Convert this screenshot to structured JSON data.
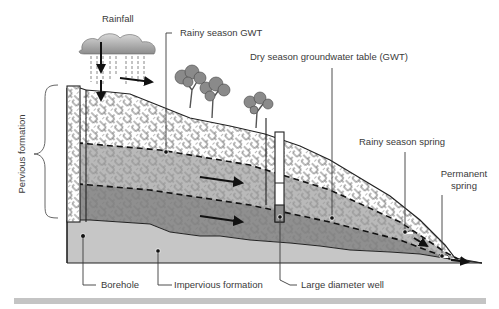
{
  "labels": {
    "rainfall": "Rainfall",
    "rainy_gwt": "Rainy season GWT",
    "dry_gwt": "Dry season groundwater table (GWT)",
    "rainy_spring": "Rainy season spring",
    "permanent_spring_line1": "Permanent",
    "permanent_spring_line2": "spring",
    "pervious_formation": "Pervious formation",
    "borehole": "Borehole",
    "impervious_formation": "Impervious formation",
    "large_diameter_well": "Large diameter well"
  },
  "colors": {
    "unsaturated": "#ffffff",
    "rainy_zone": "#b9b9b9",
    "saturated": "#8f8f8f",
    "impervious": "#c6c6c6",
    "cloud": "#9a9a9a",
    "tree": "#8a8a8a",
    "outline": "#222222",
    "footer_bar": "#c4c4c4"
  },
  "icons": [
    "rain-cloud-icon",
    "tree-icon",
    "flow-arrow-icon"
  ]
}
